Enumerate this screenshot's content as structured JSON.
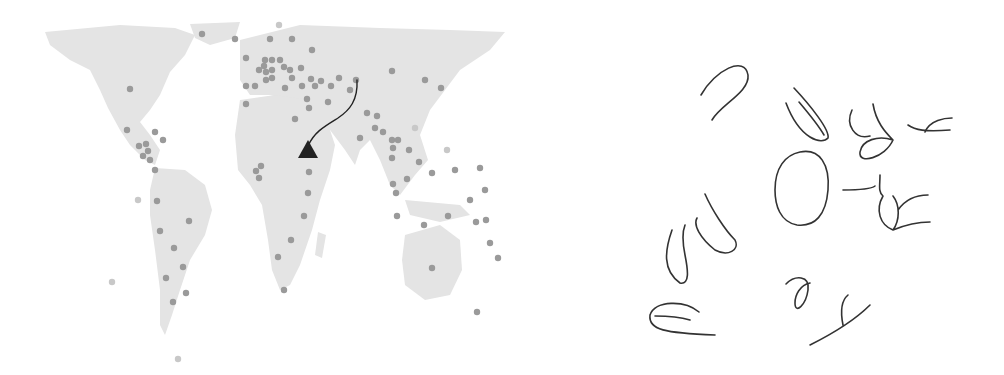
{
  "figure": {
    "colors": {
      "land": "#e4e4e4",
      "dot": "#9a9a9a",
      "dot_faint": "#c8c8c8",
      "marker": "#222222",
      "ink": "#333333"
    },
    "origin_marker": {
      "shape": "triangle",
      "region": "East Africa"
    },
    "path": {
      "from": "East Africa",
      "to": "Central Asia"
    },
    "dots": [
      [
        202,
        34
      ],
      [
        235,
        39
      ],
      [
        270,
        39
      ],
      [
        292,
        39
      ],
      [
        312,
        50
      ],
      [
        246,
        58
      ],
      [
        265,
        60
      ],
      [
        272,
        60
      ],
      [
        280,
        60
      ],
      [
        264,
        66
      ],
      [
        272,
        70
      ],
      [
        284,
        67
      ],
      [
        259,
        70
      ],
      [
        266,
        72
      ],
      [
        290,
        70
      ],
      [
        301,
        68
      ],
      [
        266,
        80
      ],
      [
        272,
        78
      ],
      [
        292,
        78
      ],
      [
        311,
        79
      ],
      [
        321,
        81
      ],
      [
        339,
        78
      ],
      [
        356,
        80
      ],
      [
        246,
        86
      ],
      [
        255,
        86
      ],
      [
        285,
        88
      ],
      [
        302,
        86
      ],
      [
        315,
        86
      ],
      [
        331,
        86
      ],
      [
        350,
        90
      ],
      [
        130,
        89
      ],
      [
        392,
        71
      ],
      [
        425,
        80
      ],
      [
        441,
        88
      ],
      [
        246,
        104
      ],
      [
        307,
        99
      ],
      [
        309,
        108
      ],
      [
        328,
        102
      ],
      [
        295,
        119
      ],
      [
        367,
        113
      ],
      [
        377,
        116
      ],
      [
        375,
        128
      ],
      [
        383,
        132
      ],
      [
        360,
        138
      ],
      [
        392,
        140
      ],
      [
        398,
        140
      ],
      [
        393,
        148
      ],
      [
        392,
        158
      ],
      [
        409,
        150
      ],
      [
        127,
        130
      ],
      [
        155,
        132
      ],
      [
        163,
        140
      ],
      [
        139,
        146
      ],
      [
        146,
        144
      ],
      [
        148,
        151
      ],
      [
        143,
        156
      ],
      [
        150,
        160
      ],
      [
        155,
        170
      ],
      [
        261,
        166
      ],
      [
        256,
        171
      ],
      [
        259,
        178
      ],
      [
        309,
        172
      ],
      [
        419,
        162
      ],
      [
        432,
        173
      ],
      [
        455,
        170
      ],
      [
        480,
        168
      ],
      [
        485,
        190
      ],
      [
        407,
        179
      ],
      [
        393,
        184
      ],
      [
        396,
        193
      ],
      [
        308,
        193
      ],
      [
        157,
        201
      ],
      [
        189,
        221
      ],
      [
        160,
        231
      ],
      [
        174,
        248
      ],
      [
        183,
        267
      ],
      [
        166,
        278
      ],
      [
        186,
        293
      ],
      [
        173,
        302
      ],
      [
        304,
        216
      ],
      [
        291,
        240
      ],
      [
        278,
        257
      ],
      [
        284,
        290
      ],
      [
        397,
        216
      ],
      [
        424,
        225
      ],
      [
        448,
        216
      ],
      [
        470,
        200
      ],
      [
        476,
        222
      ],
      [
        486,
        220
      ],
      [
        490,
        243
      ],
      [
        498,
        258
      ],
      [
        432,
        268
      ],
      [
        477,
        312
      ],
      [
        138,
        200
      ],
      [
        112,
        282
      ],
      [
        178,
        359
      ],
      [
        447,
        150
      ]
    ],
    "faint_dots": [
      [
        138,
        200
      ],
      [
        112,
        282
      ],
      [
        178,
        359
      ],
      [
        447,
        150
      ],
      [
        415,
        128
      ],
      [
        279,
        25
      ]
    ]
  }
}
